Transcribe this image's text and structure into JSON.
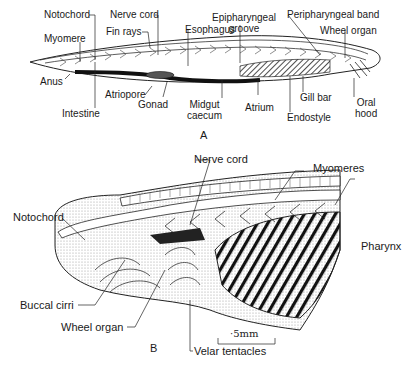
{
  "figure": {
    "panel_a": {
      "letter": "A",
      "title": "Amphioxus lateral view",
      "labels": {
        "notochord": "Notochord",
        "nerve_cord": "Nerve cord",
        "fin_rays": "Fin rays",
        "myomere": "Myomere",
        "esophagus": "Esophagus",
        "epipharyngeal_groove_1": "Epipharyngeal",
        "epipharyngeal_groove_2": "groove",
        "peripharyngeal_band": "Peripharyngeal band",
        "wheel_organ": "Wheel organ",
        "anus": "Anus",
        "atriopore": "Atriopore",
        "gonad": "Gonad",
        "intestine": "Intestine",
        "midgut_caecum_1": "Midgut",
        "midgut_caecum_2": "caecum",
        "atrium": "Atrium",
        "gill_bar": "Gill bar",
        "endostyle": "Endostyle",
        "oral_hood_1": "Oral",
        "oral_hood_2": "hood"
      }
    },
    "panel_b": {
      "letter": "B",
      "title": "Anterior end detail",
      "labels": {
        "nerve_cord": "Nerve cord",
        "myomeres": "Myomeres",
        "notochord": "Notochord",
        "pharynx": "Pharynx",
        "buccal_cirri": "Buccal cirri",
        "wheel_organ": "Wheel organ",
        "velar_tentacles": "Velar tentacles"
      },
      "scale_bar": "·5mm"
    }
  },
  "colors": {
    "ink": "#1a1a1a",
    "stipple": "#9a9a9a",
    "background": "#ffffff"
  }
}
